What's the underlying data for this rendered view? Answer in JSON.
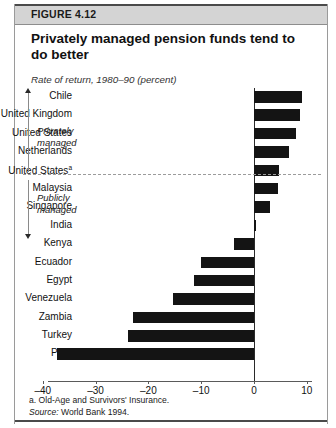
{
  "figure": {
    "number_label": "FIGURE 4.12",
    "title": "Privately managed pension funds tend to do better",
    "subtitle": "Rate of return, 1980–90 (percent)",
    "footnote": "a.  Old-Age and Survivors' Insurance.",
    "source_prefix": "Source:",
    "source_text": "World Bank 1994."
  },
  "groups": [
    {
      "id": "privately-managed",
      "label_line1": "Privately",
      "label_line2": "managed",
      "arrow": "up"
    },
    {
      "id": "publicly-managed",
      "label_line1": "Publicly",
      "label_line2": "managed",
      "arrow": "down"
    }
  ],
  "axis": {
    "ticks": [
      "–40",
      "–30",
      "–20",
      "–10",
      "0",
      "10"
    ],
    "tick_values": [
      -40,
      -30,
      -20,
      -10,
      0,
      10
    ]
  },
  "colors": {
    "bar": "#141414",
    "header_band": "#d4d4d4",
    "frame": "#9a9a9a",
    "rule": "#4a4a4a"
  },
  "chart_data": {
    "type": "bar",
    "orientation": "horizontal",
    "title": "Privately managed pension funds tend to do better",
    "subtitle": "Rate of return, 1980–90 (percent)",
    "xlabel": "",
    "ylabel": "",
    "xlim": [
      -40,
      10
    ],
    "grid": false,
    "legend": false,
    "categories": [
      "Chile",
      "United Kingdom",
      "United States",
      "Netherlands",
      "United Statesᵃ",
      "Malaysia",
      "Singapore",
      "India",
      "Kenya",
      "Ecuador",
      "Egypt",
      "Venezuela",
      "Zambia",
      "Turkey",
      "Peru"
    ],
    "values": [
      9.0,
      8.8,
      8.0,
      6.7,
      4.8,
      4.6,
      3.0,
      0.3,
      -3.8,
      -10.0,
      -11.3,
      -15.3,
      -23.0,
      -23.8,
      -37.4
    ],
    "groups": [
      {
        "name": "Privately managed",
        "categories": [
          "Chile",
          "United Kingdom",
          "United States",
          "Netherlands"
        ]
      },
      {
        "name": "Publicly managed",
        "categories": [
          "United Statesᵃ",
          "Malaysia",
          "Singapore",
          "India",
          "Kenya",
          "Ecuador",
          "Egypt",
          "Venezuela",
          "Zambia",
          "Turkey",
          "Peru"
        ]
      }
    ],
    "annotations": [
      {
        "text": "a. Old-Age and Survivors' Insurance.",
        "target": "United Statesᵃ"
      }
    ]
  },
  "rows": [
    {
      "label": "Chile",
      "sup": "",
      "value": 9.0
    },
    {
      "label": "United Kingdom",
      "sup": "",
      "value": 8.8
    },
    {
      "label": "United States",
      "sup": "",
      "value": 8.0
    },
    {
      "label": "Netherlands",
      "sup": "",
      "value": 6.7
    },
    {
      "label": "United States",
      "sup": "a",
      "value": 4.8
    },
    {
      "label": "Malaysia",
      "sup": "",
      "value": 4.6
    },
    {
      "label": "Singapore",
      "sup": "",
      "value": 3.0
    },
    {
      "label": "India",
      "sup": "",
      "value": 0.3
    },
    {
      "label": "Kenya",
      "sup": "",
      "value": -3.8
    },
    {
      "label": "Ecuador",
      "sup": "",
      "value": -10.0
    },
    {
      "label": "Egypt",
      "sup": "",
      "value": -11.3
    },
    {
      "label": "Venezuela",
      "sup": "",
      "value": -15.3
    },
    {
      "label": "Zambia",
      "sup": "",
      "value": -23.0
    },
    {
      "label": "Turkey",
      "sup": "",
      "value": -23.8
    },
    {
      "label": "Peru",
      "sup": "",
      "value": -37.4
    }
  ]
}
